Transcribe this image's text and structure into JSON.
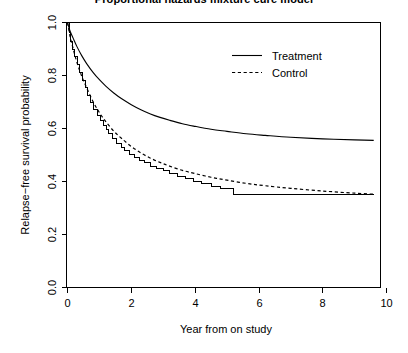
{
  "chart_data": {
    "type": "line",
    "title": "Proportional hazards mixture cure model",
    "xlabel": "Year from on study",
    "ylabel": "Relapse-free survival probability",
    "xlim": [
      0,
      10
    ],
    "ylim": [
      0.0,
      1.0
    ],
    "xticks": [
      0,
      2,
      4,
      6,
      8,
      10
    ],
    "xtick_labels": [
      "0",
      "2",
      "4",
      "6",
      "8",
      "10"
    ],
    "yticks": [
      0.0,
      0.2,
      0.4,
      0.6,
      0.8,
      1.0
    ],
    "ytick_labels": [
      "0.0",
      "0.2",
      "0.4",
      "0.6",
      "0.8",
      "1.0"
    ],
    "grid": false,
    "legend_position": "top-right",
    "legend": [
      {
        "name": "Treatment",
        "style": "solid"
      },
      {
        "name": "Control",
        "style": "dashed"
      }
    ],
    "series": [
      {
        "name": "Treatment",
        "style": "solid",
        "plateau": 0.55,
        "x": [
          0.0,
          0.08,
          0.18,
          0.3,
          0.45,
          0.6,
          0.8,
          1.0,
          1.2,
          1.45,
          1.7,
          2.0,
          2.3,
          2.6,
          2.9,
          3.2,
          3.6,
          4.0,
          4.5,
          5.0,
          5.6,
          6.2,
          7.0,
          8.0,
          9.0,
          9.6
        ],
        "y": [
          1.0,
          0.968,
          0.94,
          0.908,
          0.874,
          0.845,
          0.812,
          0.784,
          0.76,
          0.734,
          0.712,
          0.69,
          0.671,
          0.655,
          0.642,
          0.631,
          0.618,
          0.608,
          0.597,
          0.589,
          0.58,
          0.574,
          0.567,
          0.561,
          0.557,
          0.555
        ]
      },
      {
        "name": "Control",
        "style": "dashed",
        "plateau": 0.35,
        "x": [
          0.0,
          0.08,
          0.18,
          0.3,
          0.45,
          0.6,
          0.8,
          1.0,
          1.2,
          1.45,
          1.7,
          2.0,
          2.3,
          2.6,
          2.9,
          3.2,
          3.6,
          4.0,
          4.5,
          5.0,
          5.6,
          6.2,
          7.0,
          8.0,
          9.0,
          9.6
        ],
        "y": [
          1.0,
          0.948,
          0.9,
          0.848,
          0.796,
          0.754,
          0.702,
          0.66,
          0.626,
          0.59,
          0.562,
          0.532,
          0.508,
          0.488,
          0.472,
          0.458,
          0.442,
          0.43,
          0.416,
          0.405,
          0.393,
          0.384,
          0.374,
          0.364,
          0.356,
          0.352
        ]
      },
      {
        "name": "Control Kaplan-Meier",
        "style": "step",
        "plateau": 0.35,
        "x": [
          0.0,
          0.05,
          0.1,
          0.16,
          0.22,
          0.3,
          0.38,
          0.46,
          0.55,
          0.64,
          0.73,
          0.83,
          0.93,
          1.03,
          1.12,
          1.22,
          1.3,
          1.42,
          1.55,
          1.68,
          1.8,
          1.95,
          2.1,
          2.25,
          2.4,
          2.6,
          2.8,
          3.0,
          3.2,
          3.45,
          3.7,
          3.95,
          4.2,
          4.5,
          4.8,
          5.2,
          9.6
        ],
        "y": [
          1.0,
          0.962,
          0.93,
          0.9,
          0.87,
          0.84,
          0.81,
          0.782,
          0.756,
          0.726,
          0.7,
          0.672,
          0.65,
          0.63,
          0.61,
          0.596,
          0.58,
          0.562,
          0.545,
          0.53,
          0.516,
          0.503,
          0.49,
          0.48,
          0.47,
          0.458,
          0.448,
          0.44,
          0.432,
          0.42,
          0.41,
          0.4,
          0.392,
          0.38,
          0.372,
          0.35,
          0.35
        ]
      }
    ]
  },
  "axes": {
    "y_title": "Relapse−free survival probability",
    "x_title": "Year from on study"
  },
  "legend": {
    "treatment_label": "Treatment",
    "control_label": "Control"
  }
}
